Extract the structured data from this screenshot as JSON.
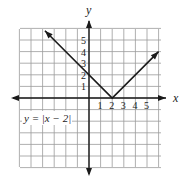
{
  "chart_data": {
    "type": "line",
    "title": "",
    "equation_label": "y = |x − 2|",
    "xlabel": "x",
    "ylabel": "y",
    "x_tick_labels": [
      "1",
      "2",
      "3",
      "4",
      "5"
    ],
    "y_tick_labels": [
      "1",
      "2",
      "3",
      "4",
      "5"
    ],
    "xlim": [
      -6,
      6
    ],
    "ylim": [
      -6,
      6
    ],
    "grid": true,
    "series": [
      {
        "name": "y = |x − 2|",
        "x": [
          -3.8,
          2,
          6
        ],
        "y": [
          5.8,
          0,
          4
        ],
        "arrows_at_ends": true
      }
    ],
    "key_points": [
      {
        "x": 0,
        "y": 2,
        "label": "y-intercept"
      },
      {
        "x": 2,
        "y": 0,
        "label": "vertex"
      }
    ]
  },
  "colors": {
    "grid": "#9a9a9a",
    "axis": "#1a1a1a",
    "curve": "#1a1a1a",
    "background": "#ffffff"
  }
}
